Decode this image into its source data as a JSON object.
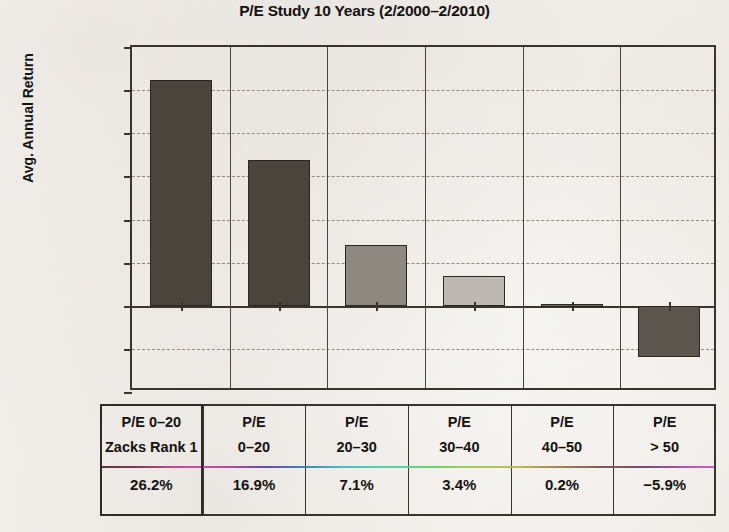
{
  "chart_data": {
    "type": "bar",
    "title": "P/E Study 10 Years (2/2000–2/2010)",
    "xlabel": "",
    "ylabel": "Avg. Annual Return",
    "ylim": [
      -10,
      30
    ],
    "grid": true,
    "legend": "none",
    "categories": [
      "P/E 0–20\nZacks Rank 1",
      "P/E\n0–20",
      "P/E\n20–30",
      "P/E\n30–40",
      "P/E\n40–50",
      "P/E\n> 50"
    ],
    "values": [
      26.2,
      16.9,
      7.1,
      3.4,
      0.2,
      -5.9
    ],
    "value_labels": [
      "26.2%",
      "16.9%",
      "7.1%",
      "3.4%",
      "0.2%",
      "−5.9%"
    ],
    "bar_colors": [
      "#4a443c",
      "#4a443c",
      "#8d8880",
      "#bdb9b2",
      "#6f6a63",
      "#5c564e"
    ],
    "yticks": [
      30,
      25,
      20,
      15,
      10,
      5,
      0,
      -5,
      -10
    ],
    "ytick_labels": [
      "30.0%",
      "25.0%",
      "20.0%",
      "15.0%",
      "10.0%",
      "5.0%",
      "0.0%",
      "−5.0%",
      "−10.0%"
    ],
    "highlighted_category_index": 0
  },
  "table": {
    "headers": [
      "P/E 0–20\nZacks Rank 1",
      "P/E\n0–20",
      "P/E\n20–30",
      "P/E\n30–40",
      "P/E\n40–50",
      "P/E\n> 50"
    ],
    "values": [
      "26.2%",
      "16.9%",
      "7.1%",
      "3.4%",
      "0.2%",
      "−5.9%"
    ]
  },
  "style": {
    "axis_color": "#3a342e",
    "grid_color": "#8e8880",
    "paper_color": "#f5f2ef",
    "highlight_border_color": "#2f2a25"
  }
}
